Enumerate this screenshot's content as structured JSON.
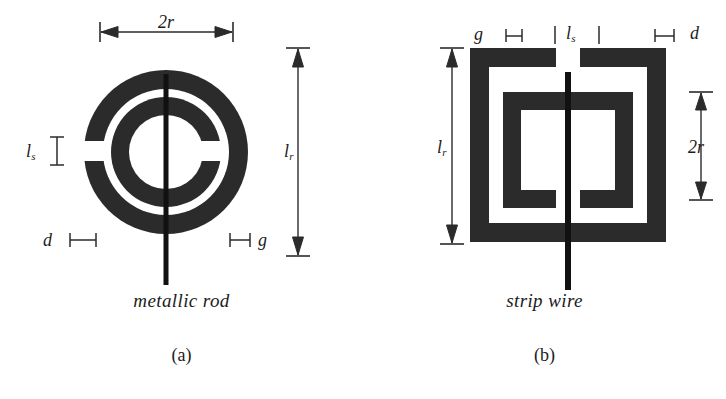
{
  "figure": {
    "background_color": "#ffffff",
    "ink_color": "#2b2b2b",
    "rod_color": "#111111"
  },
  "panels": [
    {
      "id": "a",
      "label": "(a)",
      "caption": "metallic rod",
      "resonator_shape": "circular split-ring resonator",
      "outer_ring_gap_side": "left",
      "inner_ring_gap_side": "right",
      "wire_type": "metallic rod",
      "wire_orientation": "vertical",
      "dimensions": [
        {
          "name": "2r",
          "symbol": "2r",
          "sub": "",
          "orientation": "horizontal",
          "position": "top",
          "meaning": "outer ring diameter"
        },
        {
          "name": "l_r",
          "symbol": "l",
          "sub": "r",
          "orientation": "vertical",
          "position": "right",
          "meaning": "rod length"
        },
        {
          "name": "l_s",
          "symbol": "l",
          "sub": "s",
          "orientation": "vertical",
          "position": "left",
          "meaning": "split gap length"
        },
        {
          "name": "d",
          "symbol": "d",
          "sub": "",
          "orientation": "horizontal",
          "position": "bottom-left",
          "meaning": "ring trace width"
        },
        {
          "name": "g",
          "symbol": "g",
          "sub": "",
          "orientation": "horizontal",
          "position": "bottom-right",
          "meaning": "spacing between rings"
        }
      ]
    },
    {
      "id": "b",
      "label": "(b)",
      "caption": "strip wire",
      "resonator_shape": "square split-ring resonator",
      "outer_ring_gap_side": "top",
      "inner_ring_gap_side": "bottom",
      "wire_type": "strip wire",
      "wire_orientation": "vertical",
      "dimensions": [
        {
          "name": "g",
          "symbol": "g",
          "sub": "",
          "orientation": "horizontal",
          "position": "top-left",
          "meaning": "spacing between rings"
        },
        {
          "name": "l_s",
          "symbol": "l",
          "sub": "s",
          "orientation": "horizontal",
          "position": "top-center",
          "meaning": "split gap length"
        },
        {
          "name": "d",
          "symbol": "d",
          "sub": "",
          "orientation": "horizontal",
          "position": "top-right",
          "meaning": "ring trace width"
        },
        {
          "name": "l_r",
          "symbol": "l",
          "sub": "r",
          "orientation": "vertical",
          "position": "left",
          "meaning": "strip wire length"
        },
        {
          "name": "2r",
          "symbol": "2r",
          "sub": "",
          "orientation": "vertical",
          "position": "right",
          "meaning": "inner square side"
        }
      ]
    }
  ],
  "labels": {
    "two_r": "2r",
    "l": "l",
    "sub_r": "r",
    "sub_s": "s",
    "d": "d",
    "g": "g",
    "caption_a": "metallic rod",
    "caption_b": "strip wire",
    "panel_a": "(a)",
    "panel_b": "(b)"
  }
}
